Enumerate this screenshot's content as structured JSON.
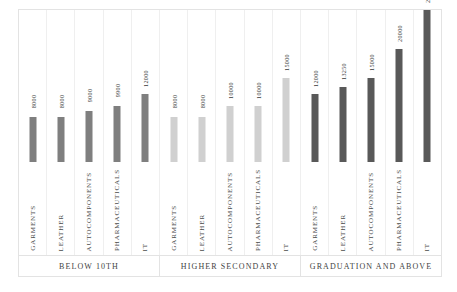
{
  "chart_data": {
    "type": "bar",
    "title": "",
    "subtitle": "",
    "xlabel": "",
    "ylabel": "",
    "ylim": [
      0,
      27000
    ],
    "grid": false,
    "legend_position": "none",
    "orientation": "vertical",
    "value_labels_shown": true,
    "categories": [
      "GARMENTS",
      "LEATHER",
      "AUTOCOMPONENTS",
      "PHARMACEUTICALS",
      "IT"
    ],
    "group_labels": [
      "BELOW 10TH",
      "HIGHER SECONDARY",
      "GRADUATION AND ABOVE"
    ],
    "series": [
      {
        "name": "BELOW 10TH",
        "color": "#7f7f7f",
        "values": [
          8000,
          8000,
          9000,
          9900,
          12000
        ]
      },
      {
        "name": "HIGHER SECONDARY",
        "color": "#d0d0d0",
        "values": [
          8000,
          8000,
          10000,
          10000,
          15000
        ]
      },
      {
        "name": "GRADUATION AND ABOVE",
        "color": "#595959",
        "values": [
          12000,
          13250,
          15000,
          20000,
          27000
        ]
      }
    ],
    "bars": [
      {
        "group": "BELOW 10TH",
        "category": "GARMENTS",
        "value": 8000,
        "label": "8000",
        "color": "#7f7f7f"
      },
      {
        "group": "BELOW 10TH",
        "category": "LEATHER",
        "value": 8000,
        "label": "8000",
        "color": "#7f7f7f"
      },
      {
        "group": "BELOW 10TH",
        "category": "AUTOCOMPONENTS",
        "value": 9000,
        "label": "9000",
        "color": "#7f7f7f"
      },
      {
        "group": "BELOW 10TH",
        "category": "PHARMACEUTICALS",
        "value": 9900,
        "label": "9900",
        "color": "#7f7f7f"
      },
      {
        "group": "BELOW 10TH",
        "category": "IT",
        "value": 12000,
        "label": "12000",
        "color": "#7f7f7f"
      },
      {
        "group": "HIGHER SECONDARY",
        "category": "GARMENTS",
        "value": 8000,
        "label": "8000",
        "color": "#d0d0d0"
      },
      {
        "group": "HIGHER SECONDARY",
        "category": "LEATHER",
        "value": 8000,
        "label": "8000",
        "color": "#d0d0d0"
      },
      {
        "group": "HIGHER SECONDARY",
        "category": "AUTOCOMPONENTS",
        "value": 10000,
        "label": "10000",
        "color": "#d0d0d0"
      },
      {
        "group": "HIGHER SECONDARY",
        "category": "PHARMACEUTICALS",
        "value": 10000,
        "label": "10000",
        "color": "#d0d0d0"
      },
      {
        "group": "HIGHER SECONDARY",
        "category": "IT",
        "value": 15000,
        "label": "15000",
        "color": "#d0d0d0"
      },
      {
        "group": "GRADUATION AND ABOVE",
        "category": "GARMENTS",
        "value": 12000,
        "label": "12000",
        "color": "#595959"
      },
      {
        "group": "GRADUATION AND ABOVE",
        "category": "LEATHER",
        "value": 13250,
        "label": "13250",
        "color": "#595959"
      },
      {
        "group": "GRADUATION AND ABOVE",
        "category": "AUTOCOMPONENTS",
        "value": 15000,
        "label": "15000",
        "color": "#595959"
      },
      {
        "group": "GRADUATION AND ABOVE",
        "category": "PHARMACEUTICALS",
        "value": 20000,
        "label": "20000",
        "color": "#595959"
      },
      {
        "group": "GRADUATION AND ABOVE",
        "category": "IT",
        "value": 27000,
        "label": "27000",
        "color": "#595959"
      }
    ]
  }
}
